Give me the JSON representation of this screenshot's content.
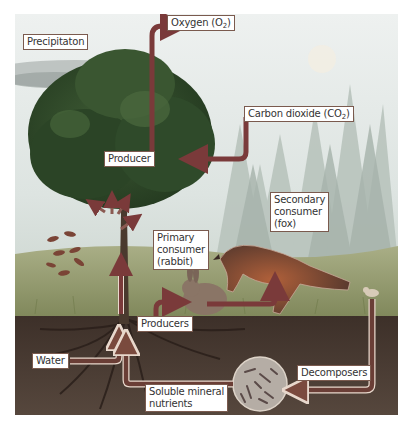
{
  "diagram": {
    "type": "ecosystem nutrient and energy cycle",
    "labels": {
      "precipitation": "Precipitaton",
      "oxygen_prefix": "Oxygen (O",
      "oxygen_sub": "2",
      "oxygen_suffix": ")",
      "carbon_prefix": "Carbon dioxide (CO",
      "carbon_sub": "2",
      "carbon_suffix": ")",
      "producer": "Producer",
      "secondary_consumer_line1": "Secondary",
      "secondary_consumer_line2": "consumer",
      "secondary_consumer_line3": "(fox)",
      "primary_consumer_line1": "Primary",
      "primary_consumer_line2": "consumer",
      "primary_consumer_line3": "(rabbit)",
      "producers": "Producers",
      "water": "Water",
      "decomposers": "Decomposers",
      "soluble_line1": "Soluble mineral",
      "soluble_line2": "nutrients"
    },
    "colors": {
      "arrow": "#7a3a3a",
      "label_border": "#7a5a4e",
      "soil": "#4a3b32",
      "sky": "#dfe6e4",
      "tree": "#2f4a2a",
      "grass": "#8a8f5a"
    }
  }
}
